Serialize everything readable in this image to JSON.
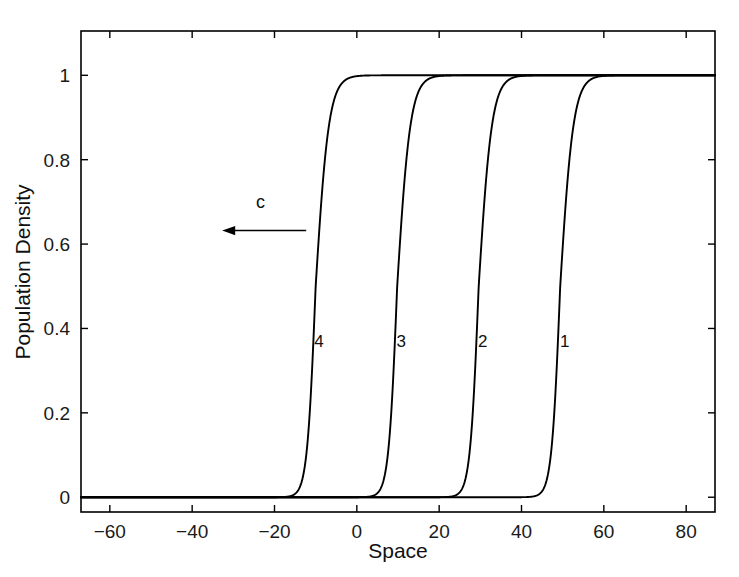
{
  "chart_data": {
    "type": "line",
    "title": "",
    "xlabel": "Space",
    "ylabel": "Population Density",
    "xlim": [
      -67,
      87
    ],
    "ylim": [
      -0.035,
      1.105
    ],
    "grid": false,
    "legend": "none",
    "xticks": [
      -60,
      -40,
      -20,
      0,
      20,
      40,
      60,
      80
    ],
    "xtick_labels": [
      "−60",
      "−40",
      "−20",
      "0",
      "20",
      "40",
      "60",
      "80"
    ],
    "yticks": [
      0,
      0.2,
      0.4,
      0.6,
      0.8,
      1
    ],
    "ytick_labels": [
      "0",
      "0.2",
      "0.4",
      "0.6",
      "0.8",
      "1"
    ],
    "series": [
      {
        "name": "1",
        "label": "1",
        "label_x": 50.5,
        "label_y": 0.37,
        "front_center": 49.4,
        "steepness": 0.62,
        "plateau": 1.0,
        "color": "#000000"
      },
      {
        "name": "2",
        "label": "2",
        "label_x": 30.6,
        "label_y": 0.37,
        "front_center": 29.6,
        "steepness": 0.62,
        "plateau": 1.0,
        "color": "#000000"
      },
      {
        "name": "3",
        "label": "3",
        "label_x": 10.8,
        "label_y": 0.37,
        "front_center": 9.8,
        "steepness": 0.62,
        "plateau": 1.0,
        "color": "#000000"
      },
      {
        "name": "4",
        "label": "4",
        "label_x": -9.2,
        "label_y": 0.37,
        "front_center": -10.0,
        "steepness": 0.62,
        "plateau": 1.0,
        "color": "#000000"
      }
    ],
    "annotations": [
      {
        "name": "wave-speed-arrow",
        "text": "c",
        "text_x": -23.4,
        "text_y": 0.685,
        "arrow_from_x": -12.3,
        "arrow_to_x": -32.7,
        "arrow_y": 0.632,
        "direction": "left"
      }
    ]
  },
  "axes": {
    "frame_color": "#000000",
    "tick_direction": "in",
    "box": true
  }
}
